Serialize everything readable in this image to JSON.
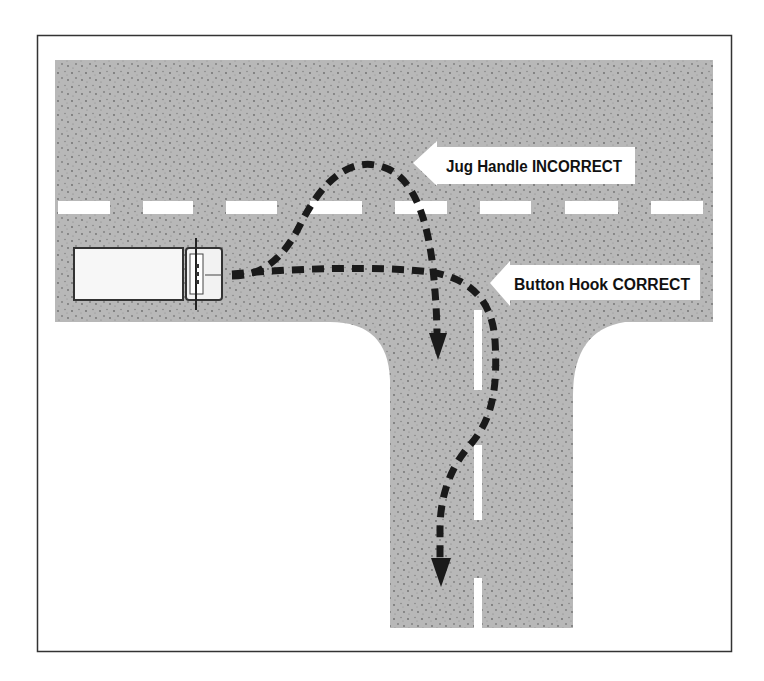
{
  "diagram": {
    "type": "road-turn-diagram",
    "colors": {
      "road": "#b4b4b4",
      "road_speckle": "#6e6e6e",
      "lane_marking": "#ffffff",
      "path": "#1a1a1a",
      "frame": "#333333",
      "sign_fill": "#ffffff",
      "text": "#111111"
    },
    "labels": {
      "jug_handle": "Jug Handle INCORRECT",
      "button_hook": "Button Hook CORRECT"
    },
    "elements": {
      "vehicle": "truck-top-view",
      "paths": [
        "jug-handle-path",
        "button-hook-path"
      ]
    }
  }
}
